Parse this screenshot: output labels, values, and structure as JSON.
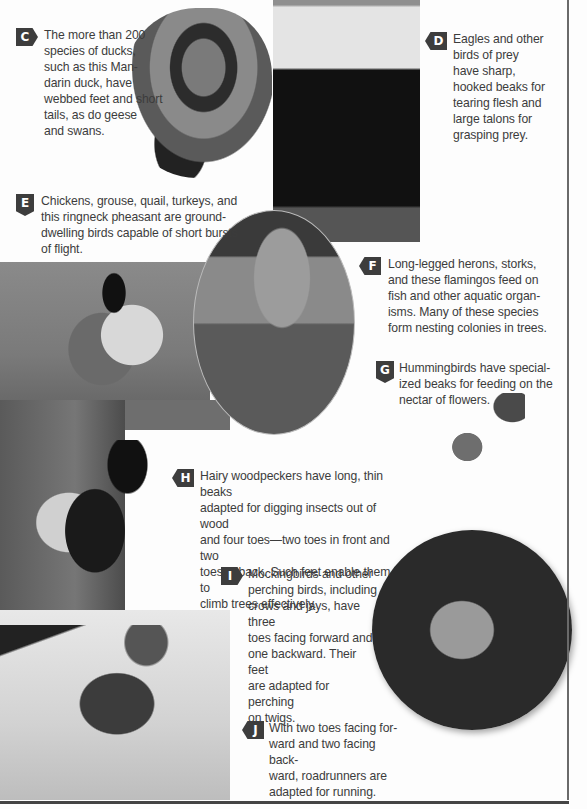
{
  "page": {
    "sections": [
      {
        "label": "C",
        "text_lines": [
          "The more than 200",
          "species of ducks,",
          "such as this Man-",
          "darin duck, have",
          "webbed feet and short",
          "tails, as do geese",
          "and swans."
        ],
        "photo": "mandarin-duck"
      },
      {
        "label": "D",
        "text_lines": [
          "Eagles and other",
          "birds of prey",
          "have sharp,",
          "hooked beaks for",
          "tearing flesh and",
          "large talons for",
          "grasping prey."
        ],
        "photo": "bald-eagle"
      },
      {
        "label": "E",
        "text_lines": [
          "Chickens, grouse, quail, turkeys, and",
          "this ringneck pheasant are ground-",
          "dwelling birds capable of short bursts",
          "of flight."
        ],
        "photo": "ringneck-pheasant"
      },
      {
        "label": "F",
        "text_lines": [
          "Long-legged herons, storks,",
          "and these flamingos feed on",
          "fish and other aquatic organ-",
          "isms. Many of these species",
          "form nesting colonies in trees."
        ],
        "photo": "flamingos"
      },
      {
        "label": "G",
        "text_lines": [
          "Hummingbirds have special-",
          "ized beaks for feeding on the",
          "nectar of flowers."
        ],
        "photo": "hummingbird"
      },
      {
        "label": "H",
        "text_lines": [
          "Hairy woodpeckers have long, thin beaks",
          "adapted for digging insects out of wood",
          "and four toes—two toes in front and two",
          "toes in back. Such feet enable them to",
          "climb trees effectively."
        ],
        "photo": "hairy-woodpecker"
      },
      {
        "label": "I",
        "text_lines": [
          "Mockingbirds and other",
          "perching birds, including",
          "crows and jays, have three",
          "toes facing forward and",
          "one backward. Their feet",
          "are adapted for perching",
          "on twigs."
        ],
        "photo": "mockingbird"
      },
      {
        "label": "J",
        "text_lines": [
          "With two toes facing for-",
          "ward and two facing back-",
          "ward, roadrunners are",
          "adapted for running."
        ],
        "photo": "roadrunner"
      }
    ]
  },
  "colors": {
    "badge": "#3d3d3d",
    "text": "#3c3c3c",
    "rule": "#6a6a6a"
  }
}
